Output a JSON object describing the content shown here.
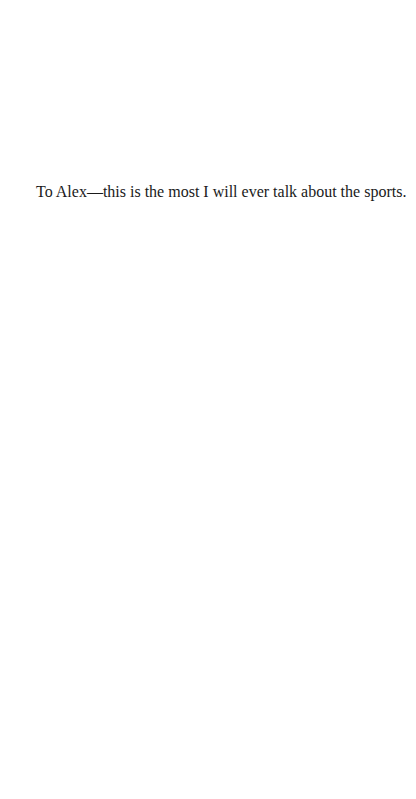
{
  "page": {
    "background_color": "#ffffff",
    "text_color": "#1a1a1a"
  },
  "dedication": {
    "text": "To Alex—this is the most I will ever talk about the sports."
  }
}
